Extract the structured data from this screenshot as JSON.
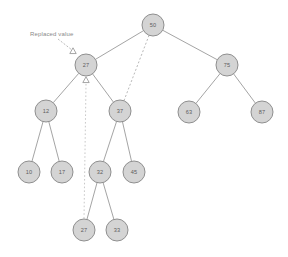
{
  "diagram": {
    "canvas": {
      "width": 288,
      "height": 257,
      "background": "#ffffff"
    },
    "style": {
      "node_fill": "#d4d4d4",
      "node_stroke": "#8f8f8f",
      "label_color": "#5c5c5c",
      "edge_color": "#9a9a9a",
      "dotted_color": "#b0b0b0",
      "annotation_color": "#8a8a8a"
    },
    "annotation": {
      "label": "Replaced value",
      "x": 30,
      "y": 36,
      "arrow": {
        "x1": 58,
        "y1": 39,
        "x2": 72,
        "y2": 50
      }
    },
    "nodes": [
      {
        "id": "n50",
        "value": "50",
        "x": 153,
        "y": 25,
        "r": 11
      },
      {
        "id": "n27",
        "value": "27",
        "x": 86,
        "y": 65,
        "r": 11
      },
      {
        "id": "n75",
        "value": "75",
        "x": 227,
        "y": 65,
        "r": 11
      },
      {
        "id": "n12",
        "value": "12",
        "x": 46,
        "y": 111,
        "r": 11
      },
      {
        "id": "n37",
        "value": "37",
        "x": 120,
        "y": 111,
        "r": 11
      },
      {
        "id": "n63",
        "value": "63",
        "x": 189,
        "y": 112,
        "r": 11
      },
      {
        "id": "n87",
        "value": "87",
        "x": 262,
        "y": 112,
        "r": 11
      },
      {
        "id": "n10",
        "value": "10",
        "x": 29,
        "y": 172,
        "r": 11
      },
      {
        "id": "n17",
        "value": "17",
        "x": 62,
        "y": 172,
        "r": 11
      },
      {
        "id": "n32",
        "value": "32",
        "x": 100,
        "y": 172,
        "r": 11
      },
      {
        "id": "n45",
        "value": "45",
        "x": 134,
        "y": 172,
        "r": 11
      },
      {
        "id": "n27b",
        "value": "27",
        "x": 84,
        "y": 230,
        "r": 11
      },
      {
        "id": "n33",
        "value": "33",
        "x": 117,
        "y": 230,
        "r": 11
      }
    ],
    "edges": [
      {
        "from": "n50",
        "to": "n27",
        "style": "solid"
      },
      {
        "from": "n50",
        "to": "n75",
        "style": "solid"
      },
      {
        "from": "n27",
        "to": "n12",
        "style": "solid"
      },
      {
        "from": "n27",
        "to": "n37",
        "style": "solid"
      },
      {
        "from": "n75",
        "to": "n63",
        "style": "solid"
      },
      {
        "from": "n75",
        "to": "n87",
        "style": "solid"
      },
      {
        "from": "n12",
        "to": "n10",
        "style": "solid"
      },
      {
        "from": "n12",
        "to": "n17",
        "style": "solid"
      },
      {
        "from": "n37",
        "to": "n32",
        "style": "solid"
      },
      {
        "from": "n37",
        "to": "n45",
        "style": "solid"
      },
      {
        "from": "n32",
        "to": "n27b",
        "style": "solid"
      },
      {
        "from": "n32",
        "to": "n33",
        "style": "solid"
      },
      {
        "from": "n50",
        "to": "n37",
        "style": "dotted"
      }
    ],
    "markers": [
      {
        "id": "m-top",
        "x": 73,
        "y": 51,
        "note": "triangle above node 27"
      },
      {
        "id": "m-bottom",
        "x": 86,
        "y": 80,
        "note": "triangle below node 27"
      }
    ],
    "pointer_line": {
      "x1": 86,
      "y1": 84,
      "x2": 84,
      "y2": 219
    }
  }
}
